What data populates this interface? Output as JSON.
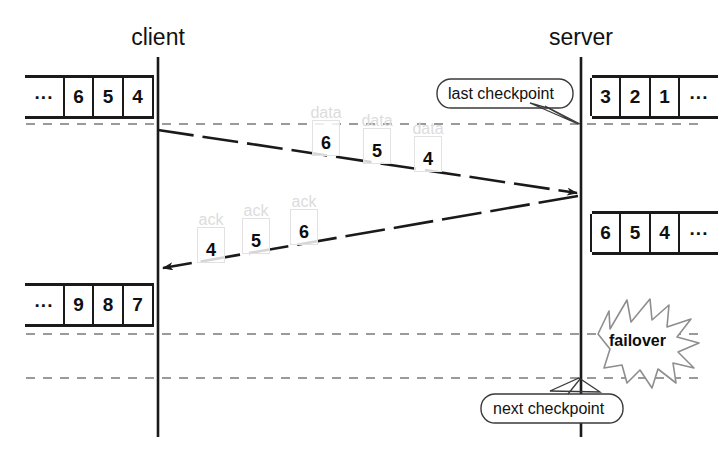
{
  "diagram": {
    "colors": {
      "line": "#1a1a1a",
      "dashed_guide": "#9a9a9a",
      "ghost_box": "#e2e2e2",
      "ghost_text": "#dcdcdc",
      "background": "#ffffff"
    },
    "lanes": [
      {
        "id": "client",
        "label": "client",
        "x": 158
      },
      {
        "id": "server",
        "label": "server",
        "x": 581
      }
    ],
    "queues": [
      {
        "id": "client-queue-before",
        "owner": "client",
        "cells": [
          "...",
          "6",
          "5",
          "4"
        ],
        "leading_ellipsis": true,
        "trailing_ellipsis": false
      },
      {
        "id": "server-queue-before",
        "owner": "server",
        "cells": [
          "3",
          "2",
          "1",
          "..."
        ],
        "leading_ellipsis": false,
        "trailing_ellipsis": true
      },
      {
        "id": "server-queue-after",
        "owner": "server",
        "cells": [
          "6",
          "5",
          "4",
          "..."
        ],
        "leading_ellipsis": false,
        "trailing_ellipsis": true
      },
      {
        "id": "client-queue-after",
        "owner": "client",
        "cells": [
          "...",
          "9",
          "8",
          "7"
        ],
        "leading_ellipsis": true,
        "trailing_ellipsis": false
      }
    ],
    "messages": [
      {
        "id": "data-message",
        "direction": "client-to-server",
        "tag": "data",
        "tokens": [
          "6",
          "5",
          "4"
        ]
      },
      {
        "id": "ack-message",
        "direction": "server-to-client",
        "tag": "ack",
        "tokens": [
          "4",
          "5",
          "6"
        ]
      }
    ],
    "guides": [
      {
        "id": "last-checkpoint-line",
        "y": 124
      },
      {
        "id": "failover-line",
        "y": 334
      },
      {
        "id": "next-checkpoint-line",
        "y": 378
      }
    ],
    "callouts": [
      {
        "id": "last-checkpoint",
        "label": "last checkpoint"
      },
      {
        "id": "next-checkpoint",
        "label": "next checkpoint"
      }
    ],
    "burst": {
      "id": "failover-burst",
      "label": "failover"
    }
  }
}
